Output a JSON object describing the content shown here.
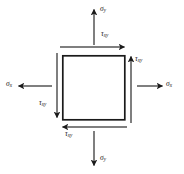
{
  "figure": {
    "name": "plane-stress-element",
    "background_color": "#ffffff",
    "stroke_color": "#1a1a1a"
  },
  "element": {
    "shape": "square",
    "x": 62,
    "y": 55,
    "width": 63,
    "height": 65,
    "fill": "#ffffff",
    "stroke": "#1a1a1a",
    "stroke_width": 1.6
  },
  "labels": {
    "sigma_top": {
      "symbol": "σ",
      "subscript": "y",
      "x": 100,
      "y": 6
    },
    "sigma_bottom": {
      "symbol": "σ",
      "subscript": "y",
      "x": 100,
      "y": 155
    },
    "sigma_left": {
      "symbol": "σ",
      "subscript": "x",
      "x": 7,
      "y": 80
    },
    "sigma_right": {
      "symbol": "σ",
      "subscript": "x",
      "x": 167,
      "y": 80
    },
    "tau_top": {
      "symbol": "τ",
      "subscript": "xy",
      "x": 101,
      "y": 31
    },
    "tau_right": {
      "symbol": "τ",
      "subscript": "xy",
      "x": 136,
      "y": 56
    },
    "tau_left": {
      "symbol": "τ",
      "subscript": "xy",
      "x": 40,
      "y": 100
    },
    "tau_bottom": {
      "symbol": "τ",
      "subscript": "xy",
      "x": 66,
      "y": 131
    }
  },
  "arrows": {
    "sigma_top": {
      "direction": "up",
      "from_x": 94,
      "from_y": 45,
      "to_x": 94,
      "to_y": 8
    },
    "sigma_bottom": {
      "direction": "down",
      "from_x": 94,
      "from_y": 131,
      "to_x": 94,
      "to_y": 167
    },
    "sigma_left": {
      "direction": "left",
      "from_x": 52,
      "from_y": 86,
      "to_x": 17,
      "to_y": 86
    },
    "sigma_right": {
      "direction": "right",
      "from_x": 136,
      "from_y": 86,
      "to_x": 164,
      "to_y": 86
    },
    "tau_top": {
      "direction": "right",
      "from_x": 60,
      "from_y": 47,
      "to_x": 126,
      "to_y": 47
    },
    "tau_right": {
      "direction": "up",
      "from_x": 131,
      "from_y": 123,
      "to_x": 131,
      "to_y": 55
    },
    "tau_left": {
      "direction": "down",
      "from_x": 57,
      "from_y": 53,
      "to_x": 57,
      "to_y": 119
    },
    "tau_bottom": {
      "direction": "left",
      "from_x": 127,
      "from_y": 127,
      "to_x": 61,
      "to_y": 127
    }
  }
}
